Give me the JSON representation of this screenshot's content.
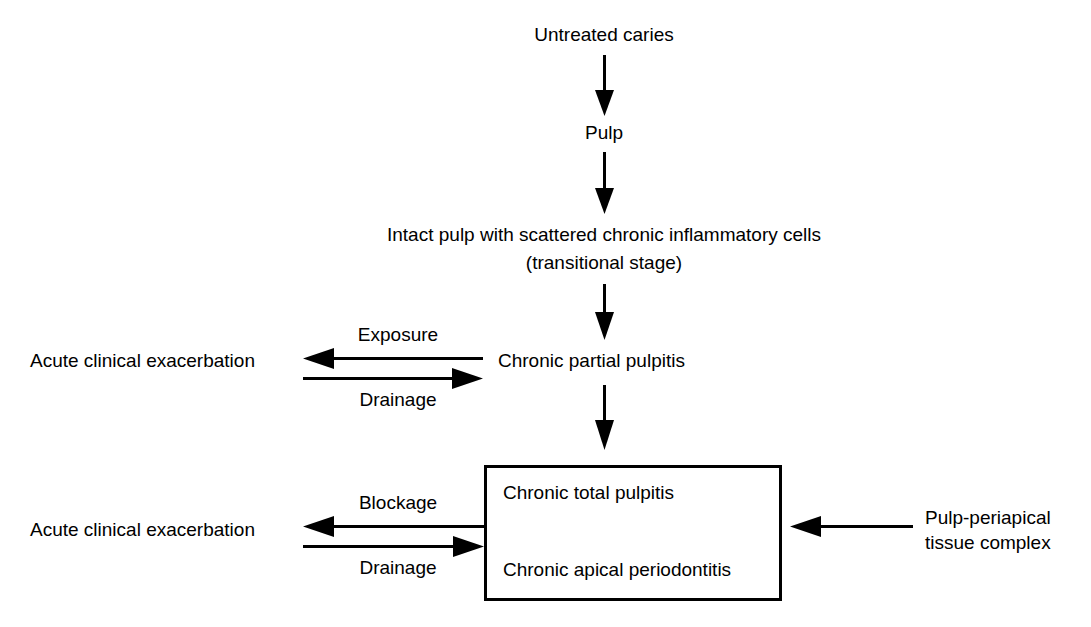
{
  "diagram": {
    "background_color": "#ffffff",
    "line_color": "#000000",
    "nodes": {
      "untreated_caries": "Untreated caries",
      "pulp": "Pulp",
      "transitional_line1": "Intact pulp with scattered chronic inflammatory cells",
      "transitional_line2": "(transitional stage)",
      "chronic_partial_pulpitis": "Chronic partial pulpitis",
      "acute_exacerbation_upper": "Acute clinical exacerbation",
      "acute_exacerbation_lower": "Acute clinical exacerbation",
      "chronic_total_pulpitis": "Chronic total pulpitis",
      "chronic_apical_periodontitis": "Chronic apical periodontitis",
      "pulp_periapical_line1": "Pulp-periapical",
      "pulp_periapical_line2": "tissue complex"
    },
    "edge_labels": {
      "exposure": "Exposure",
      "drainage_upper": "Drainage",
      "blockage": "Blockage",
      "drainage_lower": "Drainage"
    }
  }
}
